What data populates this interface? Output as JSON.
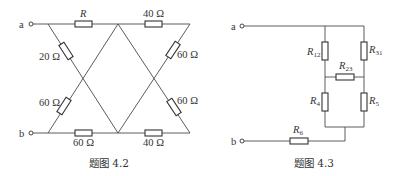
{
  "figures": [
    {
      "caption": "题图 4.2",
      "terminals": {
        "a": "a",
        "b": "b"
      },
      "resistors": {
        "top_left": {
          "label": "R"
        },
        "top_right": {
          "label": "40 Ω"
        },
        "left_upper": {
          "label": "20 Ω"
        },
        "left_lower": {
          "label": "60 Ω"
        },
        "right_upper": {
          "label": "60 Ω"
        },
        "right_lower": {
          "label": "60 Ω"
        },
        "bottom_left": {
          "label": "60 Ω"
        },
        "bottom_right": {
          "label": "40 Ω"
        }
      }
    },
    {
      "caption": "题图 4.3",
      "terminals": {
        "a": "a",
        "b": "b"
      },
      "resistors": {
        "r12": {
          "base": "R",
          "sub": "12"
        },
        "r31": {
          "base": "R",
          "sub": "31"
        },
        "r23": {
          "base": "R",
          "sub": "23"
        },
        "r4": {
          "base": "R",
          "sub": "4"
        },
        "r5": {
          "base": "R",
          "sub": "5"
        },
        "r6": {
          "base": "R",
          "sub": "6"
        }
      }
    }
  ]
}
